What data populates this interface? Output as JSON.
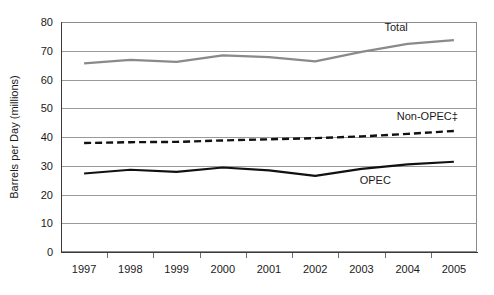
{
  "chart_data": {
    "type": "line",
    "title": "",
    "xlabel": "",
    "ylabel": "Barrels per Day (millions)",
    "ylim": [
      0,
      80
    ],
    "yticks": [
      0,
      10,
      20,
      30,
      40,
      50,
      60,
      70,
      80
    ],
    "ytick_labels": [
      "0",
      "10",
      "20",
      "30",
      "40",
      "50",
      "60",
      "70",
      "80"
    ],
    "grid": true,
    "legend_position": "inline-labels",
    "categories": [
      "1997",
      "1998",
      "1999",
      "2000",
      "2001",
      "2002",
      "2003",
      "2004",
      "2005"
    ],
    "x": [
      1997,
      1998,
      1999,
      2000,
      2001,
      2002,
      2003,
      2004,
      2005
    ],
    "series": [
      {
        "name": "Total",
        "label": "Total",
        "color": "#8a8a8a",
        "style": "solid",
        "width": 2.2,
        "values": [
          65.6,
          66.8,
          66.1,
          68.4,
          67.8,
          66.3,
          69.6,
          72.4,
          73.7
        ],
        "label_x": 2003,
        "label_y": 77.0
      },
      {
        "name": "Non-OPEC",
        "label": "Non-OPEC‡",
        "color": "#111111",
        "style": "dashed",
        "width": 2.4,
        "values": [
          37.9,
          38.2,
          38.3,
          38.8,
          39.2,
          39.6,
          40.2,
          41.1,
          42.1
        ],
        "label_x": 2003.6,
        "label_y": 45.8
      },
      {
        "name": "OPEC",
        "label": "OPEC",
        "color": "#111111",
        "style": "solid",
        "width": 2.2,
        "values": [
          27.3,
          28.6,
          27.9,
          29.4,
          28.4,
          26.5,
          28.9,
          30.5,
          31.4
        ],
        "label_x": 2002.6,
        "label_y": 23.6
      }
    ],
    "annotations": [
      {
        "text": "Total",
        "series": "Total"
      },
      {
        "text": "Non-OPEC‡",
        "series": "Non-OPEC"
      },
      {
        "text": "OPEC",
        "series": "OPEC"
      }
    ]
  }
}
